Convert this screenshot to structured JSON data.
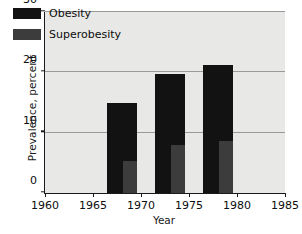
{
  "chart_data": {
    "type": "bar",
    "title": "",
    "subtitle": "",
    "xlabel": "Year",
    "ylabel": "Prevalence, percent",
    "xlim": [
      1960,
      1985
    ],
    "ylim": [
      0,
      30
    ],
    "xticks": [
      "1960",
      "1965",
      "1970",
      "1975",
      "1980",
      "1985"
    ],
    "yticks": [
      "0",
      "10",
      "20",
      "30"
    ],
    "grid": true,
    "legend_position": "top-left",
    "x": [
      1968,
      1973,
      1978
    ],
    "series": [
      {
        "name": "Obesity",
        "color": "#121212",
        "values": [
          14.9,
          19.7,
          21.3
        ]
      },
      {
        "name": "Superobesity",
        "color": "#3c3c3c",
        "values": [
          5.3,
          8.0,
          8.7
        ]
      }
    ],
    "legend": [
      "Obesity",
      "Superobesity"
    ],
    "plot_background": "#e8e8e6",
    "axis_color": "#1a1a1a",
    "gridline_color": "#9a9a98"
  },
  "axes": {
    "y_title": "Prevalence, percent",
    "x_title": "Year"
  },
  "legend_items": [
    {
      "label": "Obesity",
      "color": "#121212"
    },
    {
      "label": "Superobesity",
      "color": "#3c3c3c"
    }
  ],
  "y_tick_labels": [
    "0",
    "10",
    "20",
    "30"
  ],
  "x_tick_labels": [
    "1960",
    "1965",
    "1970",
    "1975",
    "1980",
    "1985"
  ]
}
